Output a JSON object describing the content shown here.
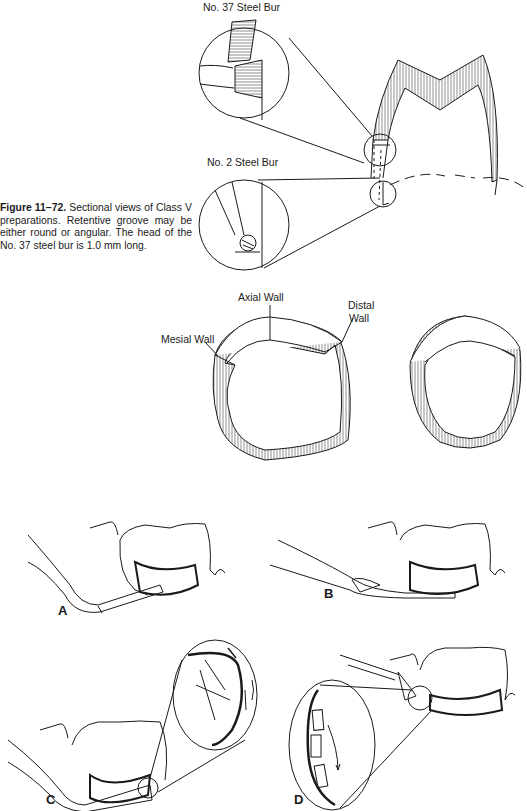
{
  "figure": {
    "number": "Figure 11–72.",
    "caption": "Sectional views of Class V preparations. Retentive groove may be either round or angular. The head of the No. 37 steel bur is 1.0 mm long."
  },
  "top_illustration": {
    "labels": {
      "bur_37": "No. 37 Steel Bur",
      "bur_2": "No. 2 Steel Bur"
    }
  },
  "cross_sections": {
    "labels": {
      "axial": "Axial Wall",
      "distal_line1": "Distal",
      "distal_line2": "Wall",
      "mesial": "Mesial Wall"
    }
  },
  "panels": [
    {
      "letter": "A"
    },
    {
      "letter": "B"
    },
    {
      "letter": "C"
    },
    {
      "letter": "D"
    }
  ],
  "colors": {
    "ink": "#1a1a1a",
    "paper": "#ffffff"
  }
}
